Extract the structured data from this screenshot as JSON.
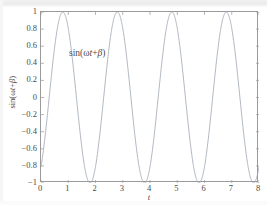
{
  "chart_data": {
    "type": "line",
    "title": "",
    "subtitle": "",
    "xlabel": "t",
    "ylabel": "sin(ωt+β)",
    "annotation": "sin(ωt+β)",
    "xlim": [
      0,
      8
    ],
    "ylim": [
      -1,
      1
    ],
    "xticks": [
      0,
      1,
      2,
      3,
      4,
      5,
      6,
      7,
      8
    ],
    "xticklabels": [
      "0",
      "1",
      "2",
      "3",
      "4",
      "5",
      "6",
      "7",
      "8"
    ],
    "yticks": [
      1,
      0.8,
      0.6,
      0.4,
      0.2,
      0,
      -0.2,
      -0.4,
      -0.6,
      -0.8,
      -1
    ],
    "yticklabels": [
      "1",
      "0.8",
      "0.6",
      "0.4",
      "0.2",
      "0",
      "−0.2",
      "−0.4",
      "−0.6",
      "−0.8",
      "−1"
    ],
    "grid": false,
    "legend": false,
    "line_color": "#9aa3b0",
    "frame_color": "#9a9a9a",
    "background": "#ffffff",
    "series": [
      {
        "name": "sin(ωt+β)",
        "formula": "sin(pi*t - 0.3*pi)",
        "omega": 3.14159,
        "beta": -0.94248,
        "amplitude": 1,
        "period": 2,
        "peaks_t": [
          0.65,
          2.65,
          4.65,
          6.65
        ],
        "troughs_t": [
          1.65,
          3.65,
          5.65,
          7.65
        ],
        "value_at_t0": -0.809,
        "zero_crossings_rising_t": [
          0.15,
          2.15,
          4.15,
          6.15
        ],
        "zero_crossings_falling_t": [
          1.15,
          3.15,
          5.15,
          7.15
        ],
        "points_t": [
          0,
          0.1,
          0.2,
          0.3,
          0.4,
          0.5,
          0.6,
          0.7,
          0.8,
          0.9,
          1,
          1.1,
          1.2,
          1.3,
          1.4,
          1.5,
          1.6,
          1.7,
          1.8,
          1.9,
          2,
          2.1,
          2.2,
          2.3,
          2.4,
          2.5,
          2.6,
          2.7,
          2.8,
          2.9,
          3,
          3.1,
          3.2,
          3.3,
          3.4,
          3.5,
          3.6,
          3.7,
          3.8,
          3.9,
          4,
          4.1,
          4.2,
          4.3,
          4.4,
          4.5,
          4.6,
          4.7,
          4.8,
          4.9,
          5,
          5.1,
          5.2,
          5.3,
          5.4,
          5.5,
          5.6,
          5.7,
          5.8,
          5.9,
          6,
          6.1,
          6.2,
          6.3,
          6.4,
          6.5,
          6.6,
          6.7,
          6.8,
          6.9,
          7,
          7.1,
          7.2,
          7.3,
          7.4,
          7.5,
          7.6,
          7.7,
          7.8,
          7.9,
          8
        ],
        "points_y": [
          -0.809,
          -0.588,
          -0.309,
          0,
          0.309,
          0.588,
          0.809,
          0.951,
          1,
          0.951,
          0.809,
          0.588,
          0.309,
          0,
          -0.309,
          -0.588,
          -0.809,
          -0.951,
          -1,
          -0.951,
          -0.809,
          -0.588,
          -0.309,
          0,
          0.309,
          0.588,
          0.809,
          0.951,
          1,
          0.951,
          0.809,
          0.588,
          0.309,
          0,
          -0.309,
          -0.588,
          -0.809,
          -0.951,
          -1,
          -0.951,
          -0.809,
          -0.588,
          -0.309,
          0,
          0.309,
          0.588,
          0.809,
          0.951,
          1,
          0.951,
          0.809,
          0.588,
          0.309,
          0,
          -0.309,
          -0.588,
          -0.809,
          -0.951,
          -1,
          -0.951,
          -0.809,
          -0.588,
          -0.309,
          0,
          0.309,
          0.588,
          0.809,
          0.951,
          1,
          0.951,
          0.809,
          0.588,
          0.309,
          0,
          -0.309,
          -0.588,
          -0.809,
          -0.951,
          -1,
          -0.951,
          -0.809
        ]
      }
    ]
  },
  "labels": {
    "xlabel": "t",
    "annotation_prefix": "sin(",
    "annotation_omega": "ω",
    "annotation_t": "t",
    "annotation_plus": "+",
    "annotation_beta": "β",
    "annotation_suffix": ")",
    "ylabel_prefix": "sin(",
    "ylabel_omega": "ω",
    "ylabel_t": "t",
    "ylabel_plus": "+",
    "ylabel_beta": "β",
    "ylabel_suffix": ")"
  }
}
